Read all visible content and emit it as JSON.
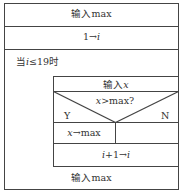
{
  "diagram": {
    "type": "nassi-shneiderman",
    "blocks": {
      "input_max_top": "输入max",
      "init_i": {
        "prefix": "1→",
        "var": "i"
      },
      "loop_condition": {
        "prefix": "当",
        "var": "i",
        "suffix": "≤19时"
      },
      "input_x": {
        "prefix": "输入",
        "var": "x"
      },
      "decision": {
        "var": "x",
        "suffix": ">max?"
      },
      "yes_label": "Y",
      "no_label": "N",
      "assign": {
        "var": "x",
        "suffix": "→max"
      },
      "increment": {
        "var1": "i",
        "mid": "+1→",
        "var2": "i"
      },
      "input_max_bottom": "输入max"
    }
  }
}
